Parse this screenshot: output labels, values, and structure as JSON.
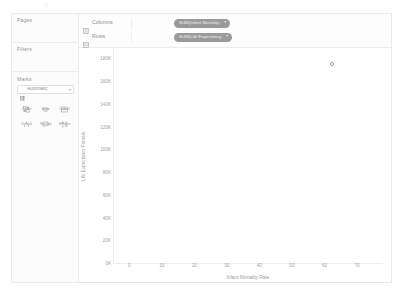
{
  "artifacts": {
    "top_left_mark": "○",
    "top_right_mark": "·"
  },
  "sidebar": {
    "cards": [
      {
        "title": "Pages",
        "name": "pages-card"
      },
      {
        "title": "Filters",
        "name": "filters-card"
      },
      {
        "title": "Marks",
        "name": "marks-card"
      }
    ],
    "marks": {
      "title": "Marks",
      "mark_type": {
        "value": "Automatic",
        "icon": "marks-type-icon",
        "caret": "▾"
      },
      "buttons": [
        {
          "label": "Color",
          "icon": "color-icon"
        },
        {
          "label": "Size",
          "icon": "size-icon"
        },
        {
          "label": "Label",
          "icon": "label-icon"
        },
        {
          "label": "Detail",
          "icon": "detail-icon"
        },
        {
          "label": "Tooltip",
          "icon": "tooltip-icon"
        },
        {
          "label": "Shape",
          "icon": "shape-icon"
        }
      ]
    }
  },
  "shelves": [
    {
      "label": "Columns",
      "icon": "columns-icon",
      "pill": {
        "text": "SUM(Infant Mortality..",
        "caret": "▾",
        "color": "#9a9a9a"
      }
    },
    {
      "label": "Rows",
      "icon": "rows-icon",
      "pill": {
        "text": "SUM(Life Expectancy..",
        "caret": "▾",
        "color": "#9a9a9a"
      }
    }
  ],
  "chart_data": {
    "type": "scatter",
    "title": "",
    "xlabel": "Infant Mortality Rate",
    "ylabel": "Life Expectancy Female",
    "xticks": [
      0,
      10,
      20,
      30,
      40,
      50,
      60,
      70
    ],
    "xticklabels": [
      "0",
      "10",
      "20",
      "30",
      "40",
      "50",
      "60",
      "70"
    ],
    "yticks": [
      0,
      20000,
      40000,
      60000,
      80000,
      100000,
      120000,
      140000,
      160000,
      180000
    ],
    "yticklabels": [
      "0K",
      "20K",
      "40K",
      "60K",
      "80K",
      "100K",
      "120K",
      "140K",
      "160K",
      "180K"
    ],
    "xlim": [
      -5,
      78
    ],
    "ylim": [
      0,
      190000
    ],
    "grid": false,
    "legend": null,
    "series": [
      {
        "name": "SUM(Infant Mortality Rate) vs SUM(Life Expectancy Female)",
        "marker": "open-circle",
        "color": "#9aa3ad",
        "points": [
          {
            "x": 62.4,
            "y": 176000
          }
        ]
      }
    ]
  }
}
